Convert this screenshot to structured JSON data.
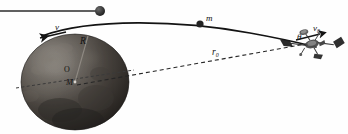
{
  "figure": {
    "background_color": "#fefefe",
    "width": 348,
    "height": 134
  },
  "labels": {
    "velocity_tangential": "v",
    "radius": "R",
    "center": "O",
    "planet_mass": "M",
    "orbiting_mass": "m",
    "initial_radius_symbol": "r",
    "initial_radius_sub": "0",
    "angle": "θ",
    "initial_velocity_symbol": "v",
    "initial_velocity_sub": "0"
  },
  "colors": {
    "planet_dark": "#2b2724",
    "planet_mid": "#55504a",
    "planet_light": "#8d8881",
    "line": "#1a1a1a",
    "dashed": "#2a2a2a",
    "marker": "#242424",
    "spacecraft": "#3a3a3a"
  },
  "geometry": {
    "planet_center_x": 75,
    "planet_center_y": 82,
    "planet_radius_x": 54,
    "planet_radius_y": 48,
    "marker_top_x": 100,
    "marker_top_y": 11,
    "mass_marker_x": 200,
    "mass_marker_y": 24,
    "spacecraft_x": 312,
    "spacecraft_y": 44
  },
  "elements": {
    "top_rule": "horizontal-line-with-ball",
    "trajectory": "curved-orbit-path",
    "radius_line": "planet-radius-segment",
    "radial_line": "dashed-radius-to-spacecraft",
    "equator_line": "dashed-equator-through-planet",
    "velocity_arrow": "tangent-velocity-arrow"
  }
}
